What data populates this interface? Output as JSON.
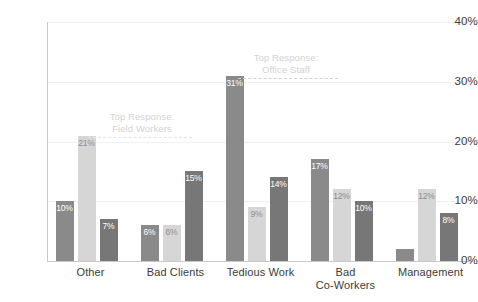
{
  "chart_data": {
    "type": "bar",
    "title": "",
    "xlabel": "",
    "ylabel": "",
    "ylim": [
      0,
      40
    ],
    "grid": true,
    "legend_position": "none",
    "categories": [
      "Other",
      "Bad Clients",
      "Tedious Work",
      "Bad Co-Workers",
      "Management"
    ],
    "category_lines": [
      [
        "Other"
      ],
      [
        "Bad Clients"
      ],
      [
        "Tedious Work"
      ],
      [
        "Bad",
        "Co-Workers"
      ],
      [
        "Management"
      ]
    ],
    "y_ticks": [
      "0%",
      "10%",
      "20%",
      "30%",
      "40%"
    ],
    "y_tick_values": [
      0,
      10,
      20,
      30,
      40
    ],
    "series": [
      {
        "name": "Series 1",
        "color": "#8a8a8a",
        "values": [
          10,
          6,
          31,
          17,
          2
        ],
        "labels": [
          "10%",
          "6%",
          "31%",
          "17%",
          "2%"
        ]
      },
      {
        "name": "Series 2",
        "color": "#d6d6d6",
        "values": [
          21,
          6,
          9,
          12,
          12
        ],
        "labels": [
          "21%",
          "6%",
          "9%",
          "12%",
          "12%"
        ]
      },
      {
        "name": "Series 3",
        "color": "#777777",
        "values": [
          7,
          15,
          14,
          10,
          8
        ],
        "labels": [
          "7%",
          "15%",
          "14%",
          "10%",
          "8%"
        ]
      }
    ],
    "annotations": [
      {
        "id": "field-workers",
        "lines": [
          "Top Response:",
          "Field Workers"
        ],
        "target_category": "Other",
        "target_series": "Series 2",
        "target_value": 21
      },
      {
        "id": "office-staff",
        "lines": [
          "Top Response:",
          "Office Staff"
        ],
        "target_category": "Tedious Work",
        "target_series": "Series 1",
        "target_value": 31
      }
    ]
  }
}
